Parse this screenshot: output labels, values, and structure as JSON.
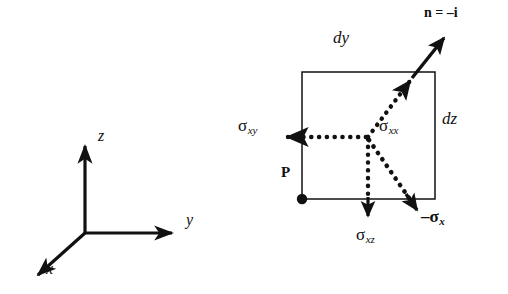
{
  "figure": {
    "background_color": "#ffffff",
    "ink_color": "#111111",
    "width": 508,
    "height": 294
  },
  "axes": {
    "name": "coordinate-triad",
    "origin": {
      "x": 85,
      "y": 233
    },
    "items": [
      {
        "id": "x",
        "label": "x",
        "tip": {
          "x": 32,
          "y": 280
        },
        "label_pos": {
          "x": 46,
          "y": 268
        }
      },
      {
        "id": "y",
        "label": "y",
        "tip": {
          "x": 178,
          "y": 233
        },
        "label_pos": {
          "x": 186,
          "y": 218
        }
      },
      {
        "id": "z",
        "label": "z",
        "tip": {
          "x": 85,
          "y": 140
        },
        "label_pos": {
          "x": 98,
          "y": 134
        }
      }
    ]
  },
  "element": {
    "name": "stress-element-face",
    "square": {
      "left": 302,
      "top": 72,
      "right": 435,
      "bottom": 199
    },
    "center_node": {
      "x": 368,
      "y": 137
    },
    "point": {
      "label": "P",
      "marker": "filled-dot",
      "dot_pos": {
        "x": 302,
        "y": 199
      },
      "label_pos": {
        "x": 281,
        "y": 173
      }
    },
    "dimensions": [
      {
        "id": "dy",
        "label": "dy",
        "label_pos": {
          "x": 333,
          "y": 38
        }
      },
      {
        "id": "dz",
        "label": "dz",
        "label_pos": {
          "x": 442,
          "y": 118
        }
      }
    ]
  },
  "normal": {
    "name": "outward-normal",
    "label": "n = –i",
    "label_pos": {
      "x": 424,
      "y": 8
    },
    "start": {
      "x": 412,
      "y": 78
    },
    "end": {
      "x": 450,
      "y": 32
    }
  },
  "vectors": [
    {
      "id": "sigma-xx",
      "symbol": "σ",
      "subscript": "xx",
      "style": "dotted",
      "bold_symbol": false,
      "from": {
        "x": 368,
        "y": 137
      },
      "to": {
        "x": 414,
        "y": 76
      },
      "label_pos": {
        "x": 379,
        "y": 126
      },
      "description": "normal stress component, dotted arrow to upper right"
    },
    {
      "id": "sigma-xy",
      "symbol": "σ",
      "subscript": "xy",
      "style": "dotted-with-solid-head",
      "bold_symbol": false,
      "from": {
        "x": 368,
        "y": 137
      },
      "to": {
        "x": 276,
        "y": 137
      },
      "label_pos": {
        "x": 238,
        "y": 126
      },
      "description": "shear stress component, dotted arrow to the left"
    },
    {
      "id": "sigma-xz",
      "symbol": "σ",
      "subscript": "xz",
      "style": "dotted-with-solid-head",
      "bold_symbol": false,
      "from": {
        "x": 368,
        "y": 137
      },
      "to": {
        "x": 368,
        "y": 224
      },
      "label_pos": {
        "x": 356,
        "y": 235
      },
      "description": "shear stress component, dotted arrow downward"
    },
    {
      "id": "minus-sigma-x",
      "symbol": "–σ",
      "subscript": "x",
      "style": "dotted-with-solid-head",
      "bold_symbol": true,
      "from": {
        "x": 368,
        "y": 137
      },
      "to": {
        "x": 422,
        "y": 216
      },
      "label_pos": {
        "x": 424,
        "y": 216
      },
      "description": "resultant traction vector, dotted arrow to lower right"
    }
  ]
}
